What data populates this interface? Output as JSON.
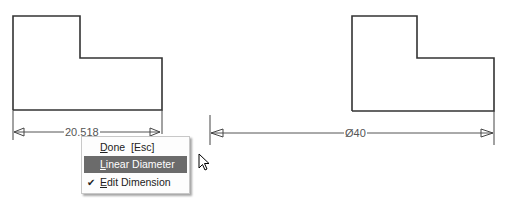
{
  "drawing": {
    "left_dimension_value": "20.518",
    "right_dimension_value": "Ø40"
  },
  "context_menu": {
    "items": [
      {
        "label": "Done",
        "mnemonic": "D",
        "rest": "one",
        "shortcut": "[Esc]",
        "highlighted": false,
        "checked": false
      },
      {
        "label": "Linear Diameter",
        "mnemonic": "L",
        "rest": "inear Diameter",
        "highlighted": true,
        "checked": false
      },
      {
        "label": "Edit Dimension",
        "mnemonic": "E",
        "rest": "dit Dimension",
        "highlighted": false,
        "checked": true
      }
    ]
  },
  "colors": {
    "line": "#333333",
    "menu_highlight": "#6b6b6b"
  }
}
